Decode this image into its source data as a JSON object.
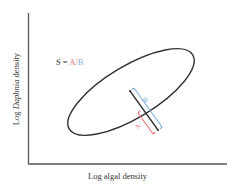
{
  "diagram": {
    "axes": {
      "x_label": "Log algal density",
      "y_label_prefix": "Log ",
      "y_label_italic": "Daphnia",
      "y_label_suffix": " density",
      "color": "#555555"
    },
    "formula": {
      "lhs": "S = ",
      "numerator": "A",
      "slash": "/",
      "denominator": "B",
      "numerator_color": "#e8707a",
      "denominator_color": "#7fb0dc"
    },
    "ellipse": {
      "cx": 130,
      "cy": 92,
      "rx": 72,
      "ry": 27,
      "rotation_deg": -32,
      "stroke": "#333333"
    },
    "transect_line": {
      "x1": 130,
      "y1": 90,
      "x2": 157,
      "y2": 130,
      "stroke": "#333333"
    },
    "bracket_A": {
      "label": "A",
      "color": "#e8707a"
    },
    "bracket_B": {
      "label": "B",
      "color": "#7fb0dc"
    }
  }
}
